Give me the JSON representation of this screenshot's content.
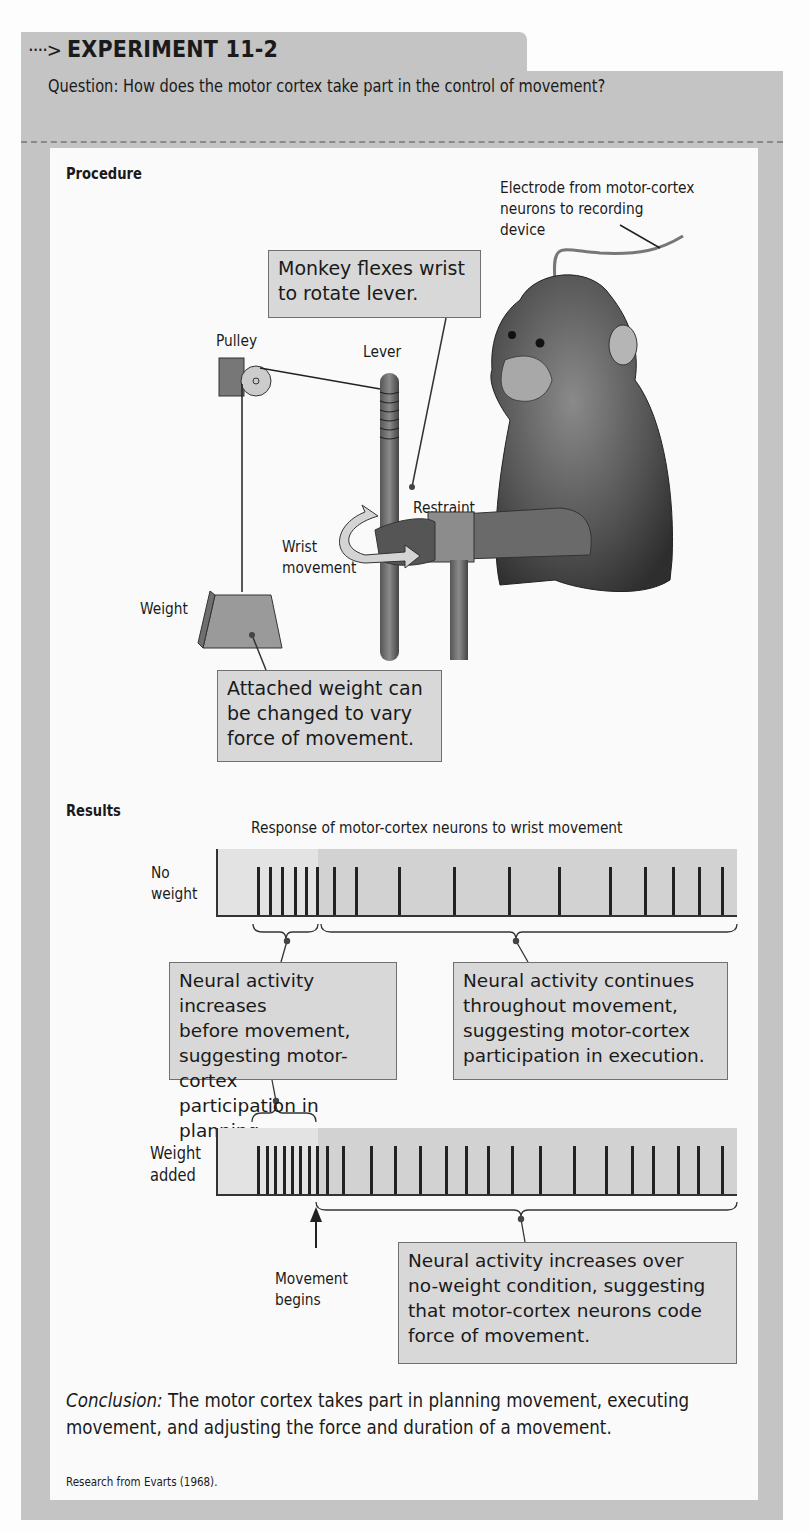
{
  "header": {
    "arrow_glyph": "····>",
    "title": "EXPERIMENT 11-2",
    "question": "Question: How does the motor cortex take part in the control of movement?"
  },
  "procedure": {
    "section_label": "Procedure",
    "labels": {
      "electrode": [
        "Electrode from motor-cortex",
        "neurons to recording",
        "device"
      ],
      "pulley": "Pulley",
      "lever": "Lever",
      "restraint": "Restraint",
      "wrist_movement": [
        "Wrist",
        "movement"
      ],
      "weight": "Weight"
    },
    "callouts": {
      "monkey": [
        "Monkey flexes wrist",
        "to rotate lever."
      ],
      "weight": [
        "Attached weight can",
        "be changed to vary",
        "force of movement."
      ]
    }
  },
  "results": {
    "section_label": "Results",
    "chart_title": "Response of motor-cortex neurons to wrist movement",
    "rows": [
      {
        "label": [
          "No",
          "weight"
        ]
      },
      {
        "label": [
          "Weight",
          "added"
        ]
      }
    ],
    "callouts": {
      "planning": [
        "Neural activity increases",
        "before movement,",
        "suggesting motor-cortex",
        "participation in planning."
      ],
      "execution": [
        "Neural activity continues",
        "throughout movement,",
        "suggesting motor-cortex",
        "participation in execution."
      ],
      "force": [
        "Neural activity increases over",
        "no-weight condition, suggesting",
        "that motor-cortex neurons code",
        "force of movement."
      ]
    },
    "movement_marker": [
      "Movement",
      "begins"
    ]
  },
  "conclusion": {
    "label": "Conclusion:",
    "text": " The motor cortex takes part in planning movement, executing movement, and adjusting the force and duration of a movement.",
    "credit": "Research from Evarts (1968)."
  },
  "colors": {
    "frame": "#c4c4c4",
    "callout_fill": "#d8d8d8",
    "chart_pre_movement": "#e3e3e3",
    "chart_movement": "#d2d2d2",
    "spike": "#222222"
  },
  "chart_data": {
    "type": "raster",
    "title": "Response of motor-cortex neurons to wrist movement",
    "xlabel": "time (movement begins at marker)",
    "movement_onset_px": 316,
    "axis_range_px": [
      217,
      736
    ],
    "series": [
      {
        "name": "No weight",
        "spike_x_px": [
          257,
          269,
          281,
          294,
          305,
          316,
          333,
          355,
          398,
          453,
          508,
          558,
          609,
          644,
          672,
          698,
          721
        ],
        "spikes_before_movement": 6,
        "spikes_during_movement": 11
      },
      {
        "name": "Weight added",
        "spike_x_px": [
          257,
          266,
          274,
          283,
          291,
          299,
          308,
          316,
          326,
          342,
          370,
          394,
          419,
          445,
          465,
          487,
          511,
          539,
          573,
          605,
          631,
          652,
          677,
          697,
          721
        ],
        "spikes_before_movement": 8,
        "spikes_during_movement": 17
      }
    ]
  }
}
